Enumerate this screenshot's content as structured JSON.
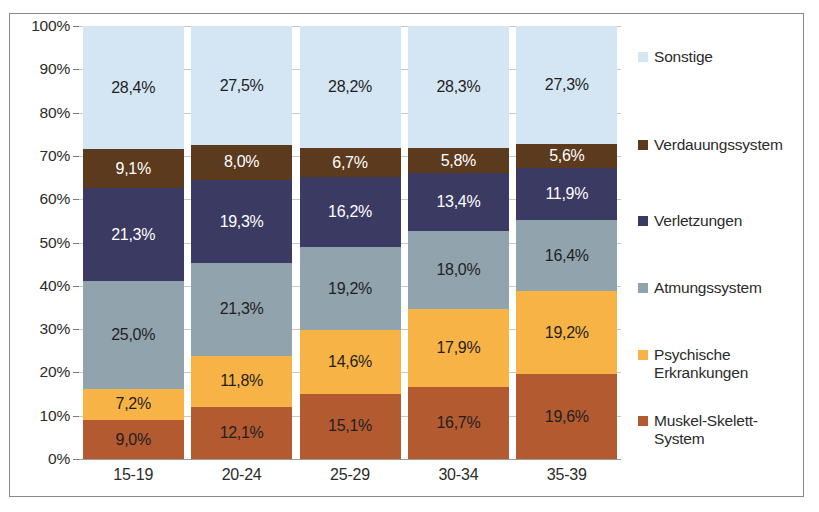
{
  "chart_data": {
    "type": "bar",
    "subtype": "stacked-100-percent",
    "title": "",
    "xlabel": "",
    "ylabel": "",
    "categories": [
      "15-19",
      "20-24",
      "25-29",
      "30-34",
      "35-39"
    ],
    "ylim": [
      0,
      100
    ],
    "ytick_labels": [
      "0%",
      "10%",
      "20%",
      "30%",
      "40%",
      "50%",
      "60%",
      "70%",
      "80%",
      "90%",
      "100%"
    ],
    "ytick_values": [
      0,
      10,
      20,
      30,
      40,
      50,
      60,
      70,
      80,
      90,
      100
    ],
    "grid": true,
    "legend_position": "right",
    "decimal_separator": ",",
    "series": [
      {
        "name": "Muskel-Skelett-System",
        "color": "#b35a31",
        "label_color": "#1f1f1f",
        "values": [
          9.0,
          12.1,
          15.1,
          16.7,
          19.6
        ],
        "labels": [
          "9,0%",
          "12,1%",
          "15,1%",
          "16,7%",
          "19,6%"
        ]
      },
      {
        "name": "Psychische Erkrankungen",
        "color": "#f7b346",
        "label_color": "#1f1f1f",
        "values": [
          7.2,
          11.8,
          14.6,
          17.9,
          19.2
        ],
        "labels": [
          "7,2%",
          "11,8%",
          "14,6%",
          "17,9%",
          "19,2%"
        ]
      },
      {
        "name": "Atmungssystem",
        "color": "#91a3ac",
        "label_color": "#1f1f1f",
        "values": [
          25.0,
          21.3,
          19.2,
          18.0,
          16.4
        ],
        "labels": [
          "25,0%",
          "21,3%",
          "19,2%",
          "18,0%",
          "16,4%"
        ]
      },
      {
        "name": "Verletzungen",
        "color": "#3b3a63",
        "label_color": "#ffffff",
        "values": [
          21.3,
          19.3,
          16.2,
          13.4,
          11.9
        ],
        "labels": [
          "21,3%",
          "19,3%",
          "16,2%",
          "13,4%",
          "11,9%"
        ]
      },
      {
        "name": "Verdauungssystem",
        "color": "#5c3a1e",
        "label_color": "#ffffff",
        "values": [
          9.1,
          8.0,
          6.7,
          5.8,
          5.6
        ],
        "labels": [
          "9,1%",
          "8,0%",
          "6,7%",
          "5,8%",
          "5,6%"
        ]
      },
      {
        "name": "Sonstige",
        "color": "#d4e6f3",
        "label_color": "#1f1f1f",
        "values": [
          28.4,
          27.5,
          28.2,
          28.3,
          27.3
        ],
        "labels": [
          "28,4%",
          "27,5%",
          "28,2%",
          "28,3%",
          "27,3%"
        ]
      }
    ]
  },
  "legend": {
    "entries": [
      {
        "label": "Sonstige",
        "color": "#d4e6f3",
        "top": 22
      },
      {
        "label": "Verdauungssystem",
        "color": "#5c3a1e",
        "top": 110
      },
      {
        "label": "Verletzungen",
        "color": "#3b3a63",
        "top": 186
      },
      {
        "label": "Atmungssystem",
        "color": "#91a3ac",
        "top": 253
      },
      {
        "label": "Psychische\nErkrankungen",
        "color": "#f7b346",
        "top": 320
      },
      {
        "label": "Muskel-Skelett-\nSystem",
        "color": "#b35a31",
        "top": 386
      }
    ]
  }
}
